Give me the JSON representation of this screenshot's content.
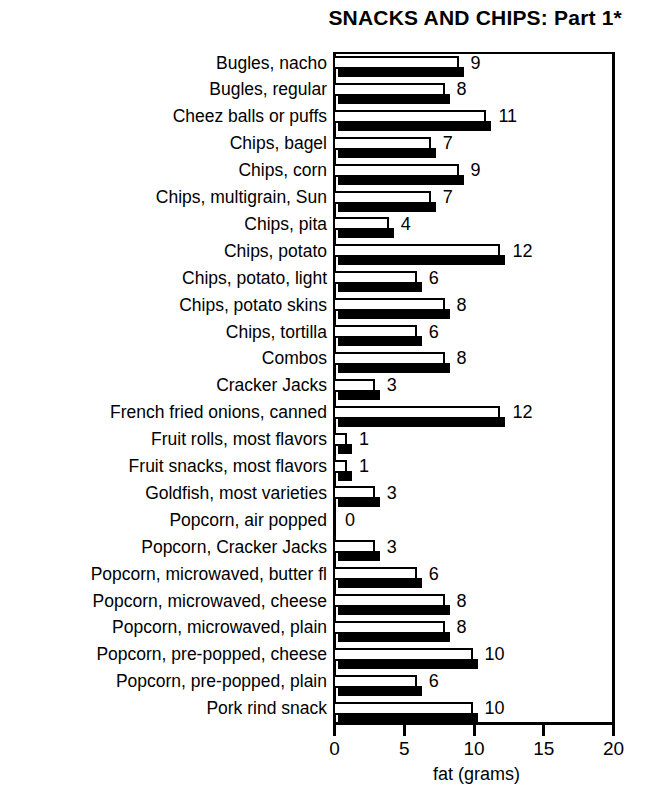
{
  "chart_data": {
    "type": "bar",
    "orientation": "horizontal",
    "title": "SNACKS AND CHIPS: Part 1*",
    "xlabel": "fat (grams)",
    "ylabel": "",
    "xlim": [
      0,
      20
    ],
    "xticks": [
      0,
      5,
      10,
      15,
      20
    ],
    "xtick_labels": [
      "0",
      "5",
      "10",
      "15",
      "20"
    ],
    "grid": false,
    "legend": null,
    "value_labels_shown": true,
    "categories": [
      "Bugles, nacho",
      "Bugles, regular",
      "Cheez balls or puffs",
      "Chips, bagel",
      "Chips, corn",
      "Chips, multigrain, Sun",
      "Chips, pita",
      "Chips, potato",
      "Chips, potato, light",
      "Chips, potato skins",
      "Chips, tortilla",
      "Combos",
      "Cracker Jacks",
      "French fried onions, canned",
      "Fruit rolls, most flavors",
      "Fruit snacks, most flavors",
      "Goldfish, most varieties",
      "Popcorn, air popped",
      "Popcorn, Cracker Jacks",
      "Popcorn, microwaved, butter fl",
      "Popcorn, microwaved, cheese",
      "Popcorn, microwaved, plain",
      "Popcorn, pre-popped, cheese",
      "Popcorn, pre-popped, plain",
      "Pork rind snack"
    ],
    "values": [
      9,
      8,
      11,
      7,
      9,
      7,
      4,
      12,
      6,
      8,
      6,
      8,
      3,
      12,
      1,
      1,
      3,
      0,
      3,
      6,
      8,
      8,
      10,
      6,
      10
    ],
    "value_label_text": [
      "9",
      "8",
      "11",
      "7",
      "9",
      "7",
      "4",
      "12",
      "6",
      "8",
      "6",
      "8",
      "3",
      "12",
      "1",
      "1",
      "3",
      "0",
      "3",
      "6",
      "8",
      "8",
      "10",
      "6",
      "10"
    ]
  },
  "colors": {
    "bar_face": "#ffffff",
    "bar_outline": "#000000",
    "bar_shadow": "#000000",
    "axis": "#000000",
    "text": "#000000",
    "background": "#ffffff"
  }
}
